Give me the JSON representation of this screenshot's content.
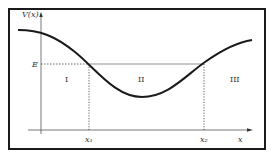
{
  "diagram": {
    "type": "potential-energy-curve",
    "y_axis_label": "V(x)",
    "x_axis_label": "x",
    "energy_label": "E",
    "turning_points": [
      "x₁",
      "x₂"
    ],
    "regions": [
      "I",
      "II",
      "III"
    ],
    "colors": {
      "ink": "#1a1a1a",
      "guide": "#555555"
    }
  }
}
